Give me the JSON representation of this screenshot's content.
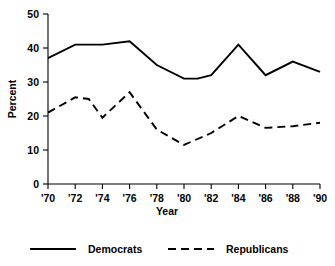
{
  "chart_data": {
    "type": "line",
    "title": "",
    "xlabel": "Year",
    "ylabel": "Percent",
    "xlim": [
      1970,
      1990
    ],
    "ylim": [
      0,
      50
    ],
    "grid": false,
    "legend_position": "bottom",
    "x": [
      1970,
      1971,
      1972,
      1973,
      1974,
      1975,
      1976,
      1977,
      1978,
      1979,
      1980,
      1981,
      1982,
      1983,
      1984,
      1985,
      1986,
      1987,
      1988,
      1989,
      1990
    ],
    "xtick_values": [
      1970,
      1972,
      1974,
      1976,
      1978,
      1980,
      1982,
      1984,
      1986,
      1988,
      1990
    ],
    "xtick_labels": [
      "'70",
      "'72",
      "'74",
      "'76",
      "'78",
      "'80",
      "'82",
      "'84",
      "'86",
      "'88",
      "'90"
    ],
    "ytick_values": [
      0,
      10,
      20,
      30,
      40,
      50
    ],
    "ytick_labels": [
      "0",
      "10",
      "20",
      "30",
      "40",
      "50"
    ],
    "series": [
      {
        "name": "Democrats",
        "style": "solid",
        "color": "#000000",
        "x": [
          1970,
          1972,
          1973,
          1974,
          1976,
          1978,
          1980,
          1981,
          1982,
          1984,
          1986,
          1988,
          1990
        ],
        "values": [
          37,
          41,
          41,
          41,
          42,
          35,
          31,
          31,
          32,
          41,
          32,
          36,
          33
        ]
      },
      {
        "name": "Republicans",
        "style": "dashed",
        "color": "#000000",
        "x": [
          1970,
          1972,
          1973,
          1974,
          1976,
          1978,
          1980,
          1982,
          1984,
          1986,
          1988,
          1990
        ],
        "values": [
          21,
          25.5,
          25,
          19.5,
          27,
          16,
          11.5,
          15,
          20,
          16.5,
          17,
          18
        ]
      }
    ],
    "legend": [
      {
        "label": "Democrats",
        "style": "solid"
      },
      {
        "label": "Republicans",
        "style": "dashed"
      }
    ]
  }
}
